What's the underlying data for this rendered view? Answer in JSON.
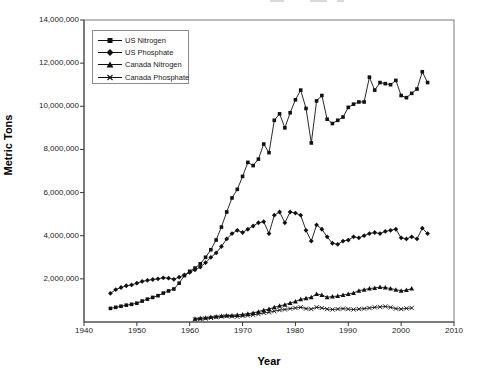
{
  "page": {
    "background": "#ffffff",
    "ink_color": "#111111",
    "frame_color": "#7a7a7a"
  },
  "chart_data": {
    "type": "line",
    "title": "",
    "xlabel": "Year",
    "ylabel": "Metric Tons",
    "xlim": [
      1940,
      2010
    ],
    "ylim": [
      0,
      14000000
    ],
    "grid": false,
    "legend_position": "top-left-inside",
    "x_ticks": [
      1940,
      1950,
      1960,
      1970,
      1980,
      1990,
      2000,
      2010
    ],
    "x_tick_labels": [
      "1940",
      "1950",
      "1960",
      "1970",
      "1980",
      "1990",
      "2000",
      "2010"
    ],
    "y_ticks": [
      14000000,
      12000000,
      10000000,
      8000000,
      6000000,
      4000000,
      2000000
    ],
    "y_tick_labels": [
      "14,000,000",
      "12,000,000",
      "10,000,000",
      "8,000,000",
      "6,000,000",
      "4,000,000",
      "2,000,000"
    ],
    "series": [
      {
        "name": "US Nitrogen",
        "marker": "square",
        "color": "#111111",
        "years": [
          1945,
          1946,
          1947,
          1948,
          1949,
          1950,
          1951,
          1952,
          1953,
          1954,
          1955,
          1956,
          1957,
          1958,
          1959,
          1960,
          1961,
          1962,
          1963,
          1964,
          1965,
          1966,
          1967,
          1968,
          1969,
          1970,
          1971,
          1972,
          1973,
          1974,
          1975,
          1976,
          1977,
          1978,
          1979,
          1980,
          1981,
          1982,
          1983,
          1984,
          1985,
          1986,
          1987,
          1988,
          1989,
          1990,
          1991,
          1992,
          1993,
          1994,
          1995,
          1996,
          1997,
          1998,
          1999,
          2000,
          2001,
          2002,
          2003,
          2004,
          2005
        ],
        "values": [
          630000,
          680000,
          730000,
          780000,
          820000,
          870000,
          970000,
          1060000,
          1140000,
          1220000,
          1340000,
          1440000,
          1530000,
          1800000,
          2150000,
          2350000,
          2500000,
          2700000,
          3000000,
          3350000,
          3800000,
          4400000,
          5100000,
          5750000,
          6150000,
          6750000,
          7400000,
          7250000,
          7550000,
          8250000,
          7850000,
          9350000,
          9650000,
          9000000,
          9700000,
          10300000,
          10750000,
          9900000,
          8300000,
          10250000,
          10500000,
          9400000,
          9200000,
          9350000,
          9500000,
          9950000,
          10100000,
          10200000,
          10200000,
          11350000,
          10750000,
          11100000,
          11050000,
          11000000,
          11200000,
          10500000,
          10400000,
          10600000,
          10800000,
          11600000,
          11100000
        ]
      },
      {
        "name": "US Phosphate",
        "marker": "diamond",
        "color": "#111111",
        "years": [
          1945,
          1946,
          1947,
          1948,
          1949,
          1950,
          1951,
          1952,
          1953,
          1954,
          1955,
          1956,
          1957,
          1958,
          1959,
          1960,
          1961,
          1962,
          1963,
          1964,
          1965,
          1966,
          1967,
          1968,
          1969,
          1970,
          1971,
          1972,
          1973,
          1974,
          1975,
          1976,
          1977,
          1978,
          1979,
          1980,
          1981,
          1982,
          1983,
          1984,
          1985,
          1986,
          1987,
          1988,
          1989,
          1990,
          1991,
          1992,
          1993,
          1994,
          1995,
          1996,
          1997,
          1998,
          1999,
          2000,
          2001,
          2002,
          2003,
          2004,
          2005
        ],
        "values": [
          1330000,
          1500000,
          1600000,
          1680000,
          1720000,
          1800000,
          1880000,
          1930000,
          1970000,
          2000000,
          2050000,
          2030000,
          1980000,
          2080000,
          2180000,
          2300000,
          2420000,
          2550000,
          2750000,
          3000000,
          3200000,
          3500000,
          3850000,
          4100000,
          4250000,
          4150000,
          4300000,
          4450000,
          4600000,
          4650000,
          4100000,
          4950000,
          5100000,
          4600000,
          5100000,
          5050000,
          4950000,
          4250000,
          3750000,
          4500000,
          4300000,
          3950000,
          3650000,
          3600000,
          3750000,
          3800000,
          3950000,
          3900000,
          4000000,
          4100000,
          4150000,
          4100000,
          4200000,
          4250000,
          4300000,
          3900000,
          3850000,
          3950000,
          3850000,
          4350000,
          4100000
        ]
      },
      {
        "name": "Canada Nitrogen",
        "marker": "triangle",
        "color": "#111111",
        "years": [
          1961,
          1962,
          1963,
          1964,
          1965,
          1966,
          1967,
          1968,
          1969,
          1970,
          1971,
          1972,
          1973,
          1974,
          1975,
          1976,
          1977,
          1978,
          1979,
          1980,
          1981,
          1982,
          1983,
          1984,
          1985,
          1986,
          1987,
          1988,
          1989,
          1990,
          1991,
          1992,
          1993,
          1994,
          1995,
          1996,
          1997,
          1998,
          1999,
          2000,
          2001,
          2002
        ],
        "values": [
          150000,
          170000,
          200000,
          230000,
          250000,
          280000,
          300000,
          300000,
          320000,
          350000,
          380000,
          420000,
          480000,
          550000,
          600000,
          680000,
          750000,
          800000,
          880000,
          950000,
          1050000,
          1100000,
          1150000,
          1300000,
          1250000,
          1150000,
          1180000,
          1200000,
          1250000,
          1300000,
          1350000,
          1450000,
          1500000,
          1550000,
          1580000,
          1620000,
          1600000,
          1550000,
          1500000,
          1450000,
          1480000,
          1550000
        ]
      },
      {
        "name": "Canada Phosphate",
        "marker": "x",
        "color": "#111111",
        "years": [
          1961,
          1962,
          1963,
          1964,
          1965,
          1966,
          1967,
          1968,
          1969,
          1970,
          1971,
          1972,
          1973,
          1974,
          1975,
          1976,
          1977,
          1978,
          1979,
          1980,
          1981,
          1982,
          1983,
          1984,
          1985,
          1986,
          1987,
          1988,
          1989,
          1990,
          1991,
          1992,
          1993,
          1994,
          1995,
          1996,
          1997,
          1998,
          1999,
          2000,
          2001,
          2002
        ],
        "values": [
          120000,
          140000,
          160000,
          190000,
          220000,
          250000,
          270000,
          260000,
          250000,
          280000,
          300000,
          330000,
          370000,
          420000,
          450000,
          500000,
          550000,
          580000,
          620000,
          650000,
          680000,
          620000,
          600000,
          680000,
          650000,
          600000,
          580000,
          600000,
          620000,
          600000,
          580000,
          600000,
          620000,
          650000,
          680000,
          700000,
          720000,
          680000,
          620000,
          600000,
          630000,
          650000
        ]
      }
    ]
  }
}
